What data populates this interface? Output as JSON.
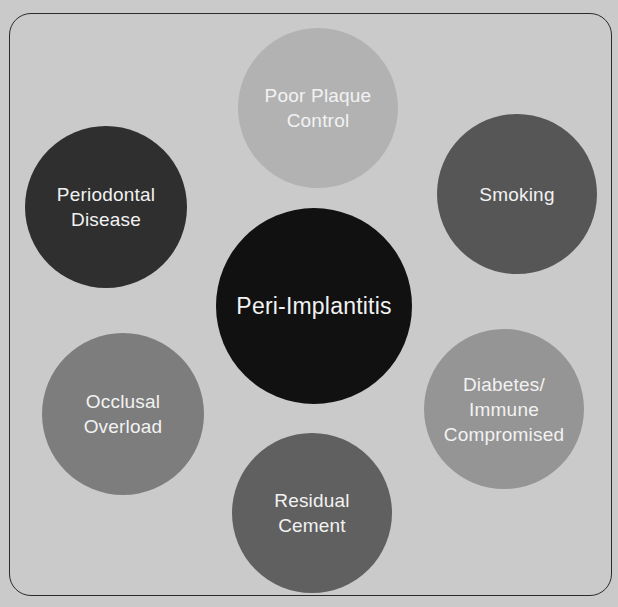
{
  "diagram": {
    "center": {
      "label": "Peri-Implantitis",
      "color": "#111111",
      "cx": 314,
      "cy": 306,
      "r": 98
    },
    "factors": [
      {
        "id": "poor-plaque-control",
        "label": "Poor Plaque\nControl",
        "color": "#b2b2b2",
        "cx": 318,
        "cy": 108,
        "r": 80
      },
      {
        "id": "smoking",
        "label": "Smoking",
        "color": "#565656",
        "cx": 517,
        "cy": 194,
        "r": 80
      },
      {
        "id": "diabetes-immune-compromised",
        "label": "Diabetes/\nImmune\nCompromised",
        "color": "#959595",
        "cx": 504,
        "cy": 409,
        "r": 80
      },
      {
        "id": "residual-cement",
        "label": "Residual\nCement",
        "color": "#606060",
        "cx": 312,
        "cy": 513,
        "r": 80
      },
      {
        "id": "occlusal-overload",
        "label": "Occlusal\nOverload",
        "color": "#7d7d7d",
        "cx": 123,
        "cy": 414,
        "r": 81
      },
      {
        "id": "periodontal-disease",
        "label": "Periodontal\nDisease",
        "color": "#2f2f2f",
        "cx": 106,
        "cy": 207,
        "r": 81
      }
    ],
    "background_color": "#cacaca",
    "frame_color": "#2a2a2a"
  }
}
